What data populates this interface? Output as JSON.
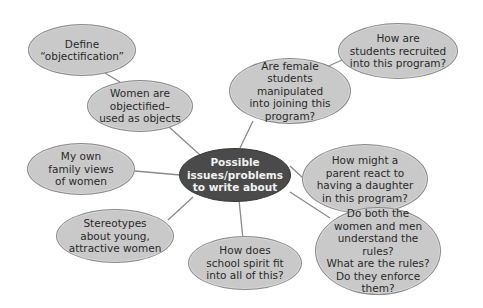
{
  "diagram": {
    "type": "mind-map",
    "colors": {
      "center_fill": "#4a4a4a",
      "center_text": "#f2f2f2",
      "node_fill": "#c9c9c9",
      "node_border": "#8a8a8a",
      "node_text": "#2a2a2a",
      "link": "#8a8a8a"
    },
    "center": {
      "label": "Possible\nissues/problems\nto write about"
    },
    "nodes": [
      {
        "id": "define",
        "label": "Define\n“objectification”"
      },
      {
        "id": "objectified",
        "label": "Women are\nobjectified–\nused as objects"
      },
      {
        "id": "manipulated",
        "label": "Are female\nstudents manipulated\ninto joining this\nprogram?"
      },
      {
        "id": "recruited",
        "label": "How are\nstudents recruited\ninto this program?"
      },
      {
        "id": "family",
        "label": "My own\nfamily views\nof women"
      },
      {
        "id": "parent",
        "label": "How might a\nparent react to\nhaving a daughter\nin this program?"
      },
      {
        "id": "stereotypes",
        "label": "Stereotypes\nabout young,\nattractive women"
      },
      {
        "id": "spirit",
        "label": "How does\nschool spirit fit\ninto all of this?"
      },
      {
        "id": "rules",
        "label": "Do both the\nwomen and men\nunderstand the rules?\nWhat are the rules?\nDo they enforce\nthem?"
      }
    ],
    "links": [
      [
        "define",
        "objectified"
      ],
      [
        "objectified",
        "center"
      ],
      [
        "manipulated",
        "center"
      ],
      [
        "recruited",
        "manipulated"
      ],
      [
        "family",
        "center"
      ],
      [
        "parent",
        "center"
      ],
      [
        "stereotypes",
        "center"
      ],
      [
        "spirit",
        "center"
      ],
      [
        "rules",
        "center"
      ]
    ]
  }
}
